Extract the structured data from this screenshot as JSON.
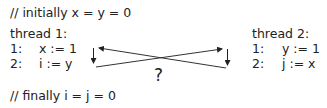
{
  "header_comment": "// initially x = y = 0",
  "footer_comment": "// finally i = j = 0",
  "thread1": {
    "title": "thread 1:",
    "lines": [
      {
        "num": "1:",
        "code": "x := 1"
      },
      {
        "num": "2:",
        "code": "i := y"
      }
    ]
  },
  "thread2": {
    "title": "thread 2:",
    "lines": [
      {
        "num": "1:",
        "code": "y := 1"
      },
      {
        "num": "2:",
        "code": "j := x"
      }
    ]
  },
  "question_mark": "?"
}
